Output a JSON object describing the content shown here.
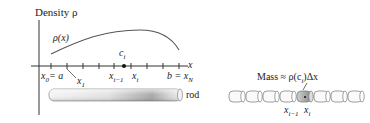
{
  "left_figure": {
    "y_axis_label": "Density ρ",
    "curve_label": "ρ(x)",
    "x_axis_label": "x",
    "point_label": "c",
    "point_sub": "i",
    "tick_labels": {
      "x0": "x",
      "x0_sub": "0",
      "x0_eq": "= a",
      "x1": "x",
      "x1_sub": "1",
      "xim1": "x",
      "xim1_sub": "i−1",
      "xi": "x",
      "xi_sub": "i",
      "b_eq": "b = x",
      "xN_sub": "N"
    },
    "rod_label": "rod"
  },
  "right_figure": {
    "mass_label": "Mass ≈ ρ(c",
    "mass_sub": "i",
    "mass_tail": ")Δx",
    "xim1": "x",
    "xim1_sub": "i−1",
    "xi": "x",
    "xi_sub": "i",
    "segment_count": 10,
    "highlighted_segment": 5
  },
  "colors": {
    "line": "#333333",
    "curve": "#555555",
    "rod_light": "#f2f2f2",
    "rod_dark": "#9a9a9a"
  }
}
